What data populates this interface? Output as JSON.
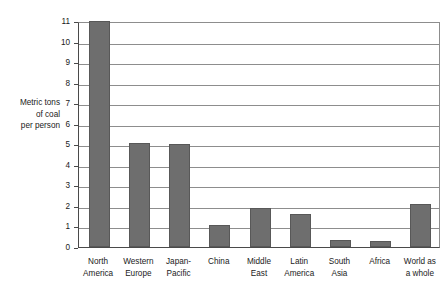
{
  "chart_data": {
    "type": "bar",
    "title": "",
    "subtitle": "",
    "xlabel": "",
    "ylabel": "Metric tons\nof coal\nper person",
    "ylabel_lines": [
      "Metric tons",
      "of coal",
      "per person"
    ],
    "ylim": [
      0,
      11
    ],
    "ytick_labels": [
      "0",
      "1",
      "2",
      "3",
      "4",
      "5",
      "6",
      "7",
      "8",
      "9",
      "10",
      "11"
    ],
    "ytick_values": [
      0,
      1,
      2,
      3,
      4,
      5,
      6,
      7,
      8,
      9,
      10,
      11
    ],
    "grid": true,
    "grid_axis": "y",
    "legend": false,
    "legend_position": "none",
    "categories": [
      "North\nAmerica",
      "Western\nEurope",
      "Japan-\nPacific",
      "China",
      "Middle\nEast",
      "Latin\nAmerica",
      "South\nAsia",
      "Africa",
      "World as\na whole"
    ],
    "category_lines": [
      [
        "North",
        "America"
      ],
      [
        "Western",
        "Europe"
      ],
      [
        "Japan-",
        "Pacific"
      ],
      [
        "China",
        ""
      ],
      [
        "Middle",
        "East"
      ],
      [
        "Latin",
        "America"
      ],
      [
        "South",
        "Asia"
      ],
      [
        "Africa",
        ""
      ],
      [
        "World as",
        "a whole"
      ]
    ],
    "values": [
      11,
      5.05,
      5,
      1.05,
      1.9,
      1.6,
      0.35,
      0.3,
      2.1
    ],
    "bar_color": "#6e6e6e",
    "bar_border_color": "#585858",
    "grid_color": "#8d8d8d",
    "axis_color": "#4a4a4a",
    "background_color": "#ffffff",
    "text_color": "#1a1a1a"
  }
}
